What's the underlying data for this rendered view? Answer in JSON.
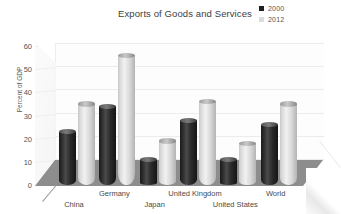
{
  "chart_data": {
    "type": "bar",
    "title": "Exports of Goods and Services",
    "xlabel": "",
    "ylabel": "Percent of GDP",
    "categories": [
      "China",
      "Germany",
      "Japan",
      "United Kingdom",
      "United States",
      "World"
    ],
    "series": [
      {
        "name": "2000",
        "color": "#1f1f1f",
        "values": [
          23,
          34,
          11,
          28,
          11,
          26
        ]
      },
      {
        "name": "2012",
        "color": "#dcdcdc",
        "values": [
          35,
          56,
          19,
          36,
          18,
          35
        ]
      }
    ],
    "ylim": [
      0,
      60
    ],
    "yticks": [
      0,
      10,
      20,
      30,
      40,
      50,
      60
    ],
    "grid": true,
    "legend_position": "top-right",
    "style": "3d-cylinder"
  },
  "legend": {
    "items": [
      {
        "label": "2000",
        "swatch": "#1f1f1f"
      },
      {
        "label": "2012",
        "swatch": "#dcdcdc"
      }
    ]
  }
}
